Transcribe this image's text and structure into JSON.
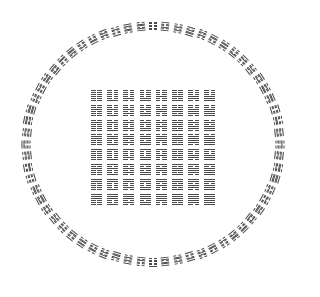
{
  "diagram": {
    "title": "Circular and square arrangement of the 64 hexagrams",
    "colors": {
      "background": "#ffffff",
      "ink": "#4a4a4a"
    },
    "ring": {
      "center": [
        153,
        144
      ],
      "radius_x": 127,
      "radius_y": 118,
      "count": 64,
      "glyph_size": [
        8,
        9
      ]
    },
    "square": {
      "origin": [
        91,
        90
      ],
      "rows": 8,
      "cols": 8,
      "cell": [
        16.2,
        14.8
      ],
      "glyph_size": [
        11,
        11
      ]
    },
    "hexagrams_square_order": [
      "000000",
      "000001",
      "000010",
      "000011",
      "000100",
      "000101",
      "000110",
      "000111",
      "001000",
      "001001",
      "001010",
      "001011",
      "001100",
      "001101",
      "001110",
      "001111",
      "010000",
      "010001",
      "010010",
      "010011",
      "010100",
      "010101",
      "010110",
      "010111",
      "011000",
      "011001",
      "011010",
      "011011",
      "011100",
      "011101",
      "011110",
      "011111",
      "100000",
      "100001",
      "100010",
      "100011",
      "100100",
      "100101",
      "100110",
      "100111",
      "101000",
      "101001",
      "101010",
      "101011",
      "101100",
      "101101",
      "101110",
      "101111",
      "110000",
      "110001",
      "110010",
      "110011",
      "110100",
      "110101",
      "110110",
      "110111",
      "111000",
      "111001",
      "111010",
      "111011",
      "111100",
      "111101",
      "111110",
      "111111"
    ]
  }
}
